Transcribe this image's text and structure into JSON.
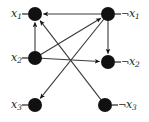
{
  "figure": {
    "width": 149,
    "height": 122,
    "background_color": "#ffffff",
    "node_color": "#111111",
    "edge_color": "#3a3a3a",
    "label_color": "#1a1a1a",
    "node_radius": 7
  },
  "graph_data": {
    "type": "diagram",
    "kind": "directed-graph",
    "layout": "bipartite-two-column",
    "nodes": [
      {
        "id": "x1",
        "label": "x",
        "subscript": "1",
        "negated": false,
        "label_text": "x₁",
        "label_side": "left",
        "x": 35,
        "y": 14
      },
      {
        "id": "nx1",
        "label": "x",
        "subscript": "1",
        "negated": true,
        "label_text": "¬x₁",
        "label_side": "right",
        "x": 108,
        "y": 14
      },
      {
        "id": "x2",
        "label": "x",
        "subscript": "2",
        "negated": false,
        "label_text": "x₂",
        "label_side": "left",
        "x": 35,
        "y": 58
      },
      {
        "id": "nx2",
        "label": "x",
        "subscript": "2",
        "negated": true,
        "label_text": "¬x₂",
        "label_side": "right",
        "x": 108,
        "y": 62
      },
      {
        "id": "x3",
        "label": "x",
        "subscript": "3",
        "negated": false,
        "label_text": "x₃",
        "label_side": "left",
        "x": 35,
        "y": 105
      },
      {
        "id": "nx3",
        "label": "x",
        "subscript": "3",
        "negated": true,
        "label_text": "¬x₃",
        "label_side": "right",
        "x": 105,
        "y": 105
      }
    ],
    "edges": [
      {
        "id": "e1",
        "from": "x2",
        "to": "x1",
        "arrow": "to"
      },
      {
        "id": "e2",
        "from": "nx1",
        "to": "nx2",
        "arrow": "to"
      },
      {
        "id": "e3",
        "from": "nx1",
        "to": "x1",
        "arrow": "to"
      },
      {
        "id": "e4",
        "from": "x2",
        "to": "nx1",
        "arrow": "to"
      },
      {
        "id": "e5",
        "from": "nx3",
        "to": "x1",
        "arrow": "to"
      },
      {
        "id": "e6",
        "from": "x2",
        "to": "nx2",
        "arrow": "to"
      },
      {
        "id": "e7",
        "from": "nx1",
        "to": "x3",
        "arrow": "to"
      }
    ]
  }
}
